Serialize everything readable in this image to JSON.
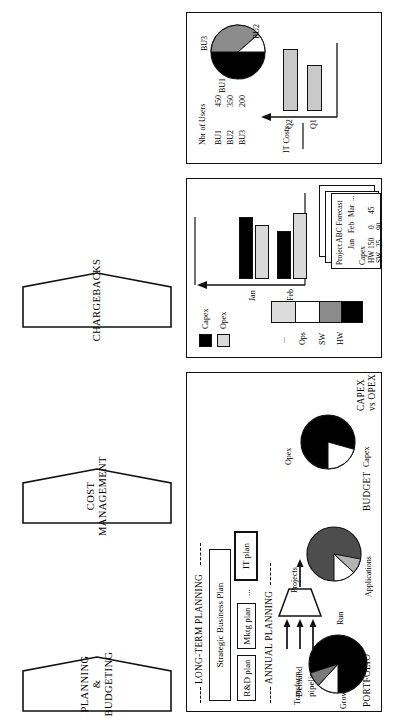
{
  "figure": {
    "orientation": "rotated-90-ccw",
    "panels": [
      {
        "id": "planning",
        "header": "PLANNING &\nBUDGETING",
        "header_line1": "PLANNING &",
        "header_line2": "BUDGETING"
      },
      {
        "id": "cost",
        "header_line1": "COST",
        "header_line2": "MANAGEMENT"
      },
      {
        "id": "chargebacks",
        "header_line1": "CHARGEBACKS",
        "header_line2": ""
      }
    ]
  },
  "planning": {
    "long_term_label": "LONG-TERM PLANNING",
    "annual_label": "ANNUAL PLANNING",
    "strategic_plan": "Strategic  Business  Plan",
    "plans": [
      {
        "label": "R&D plan"
      },
      {
        "label": "Mktg plan"
      },
      {
        "label": "..."
      },
      {
        "label": "IT plan"
      }
    ],
    "pipeline_label_1": "Demand",
    "pipeline_label_2": "pipeline",
    "footer": [
      {
        "caption": "PORTFOLIO"
      },
      {
        "caption": "BUDGET"
      },
      {
        "caption": "CAPEX\nvs OPEX"
      }
    ],
    "footer_capex_l1": "CAPEX",
    "footer_capex_l2": "vs OPEX",
    "pies": [
      {
        "name": "portfolio-pie",
        "labels": [
          "Transform",
          "Grow",
          "Run"
        ],
        "slices": [
          {
            "name": "Run",
            "value": 70,
            "color": "#000000"
          },
          {
            "name": "Grow",
            "value": 14,
            "color": "#7a7a7a"
          },
          {
            "name": "Transform",
            "value": 16,
            "color": "#ffffff"
          }
        ]
      },
      {
        "name": "budget-pie",
        "labels": [
          "Projects",
          "Applications"
        ],
        "slices": [
          {
            "name": "Applications",
            "value": 68,
            "color": "#4d4d4d"
          },
          {
            "name": "Projects",
            "value": 14,
            "color": "#b3b3b3"
          },
          {
            "name": "Other",
            "value": 18,
            "color": "#ffffff"
          }
        ]
      },
      {
        "name": "capex-opex-pie",
        "labels": [
          "Opex",
          "Capex"
        ],
        "slices": [
          {
            "name": "Capex",
            "value": 72,
            "color": "#000000"
          },
          {
            "name": "Opex",
            "value": 28,
            "color": "#ffffff"
          }
        ]
      }
    ]
  },
  "cost": {
    "legend": [
      {
        "label": "Capex",
        "color": "#000000"
      },
      {
        "label": "Opex",
        "color": "#d9d9d9"
      }
    ],
    "stack_labels": [
      "HW",
      "SW",
      "Ops",
      "..."
    ],
    "stack": [
      {
        "label": "HW",
        "color": "#000000",
        "value": 22
      },
      {
        "label": "SW",
        "color": "#8c8c8c",
        "value": 25
      },
      {
        "label": "Ops",
        "color": "#ffffff",
        "value": 27
      },
      {
        "label": "...",
        "color": "#dcdcdc",
        "value": 26
      }
    ],
    "chart": {
      "type": "bar",
      "categories": [
        "Jan",
        "Feb"
      ],
      "series": [
        {
          "name": "Capex",
          "color": "#000000",
          "values": [
            78,
            60
          ]
        },
        {
          "name": "Opex",
          "color": "#d9d9d9",
          "values": [
            68,
            82
          ]
        }
      ],
      "axis_arrow": true
    },
    "forecast": {
      "title": "Project ABC Forecast",
      "columns": [
        "",
        "Jan",
        "Feb",
        "Mar",
        "..."
      ],
      "group": "Capex",
      "rows": [
        {
          "label": "HW",
          "values": [
            "150",
            "0",
            "45",
            ""
          ]
        },
        {
          "label": "SW",
          "values": [
            "25",
            "90",
            "",
            ""
          ]
        }
      ],
      "stack_count": 3
    }
  },
  "chargebacks": {
    "users_title": "Nbr of Users",
    "users": [
      {
        "label": "BU1",
        "value": "450"
      },
      {
        "label": "BU2",
        "value": "350"
      },
      {
        "label": "BU3",
        "value": "200"
      }
    ],
    "chart": {
      "type": "bar",
      "ylabel": "IT Costs",
      "categories": [
        "Q1",
        "Q2"
      ],
      "values": [
        62,
        85
      ],
      "color": "#c9c9c9"
    },
    "pie": {
      "type": "pie",
      "labels": [
        "BU1",
        "BU2",
        "BU3"
      ],
      "slices": [
        {
          "name": "BU1",
          "value": 45,
          "color": "#000000"
        },
        {
          "name": "BU2",
          "value": 35,
          "color": "#8c8c8c"
        },
        {
          "name": "BU3",
          "value": 20,
          "color": "#ffffff"
        }
      ]
    }
  }
}
